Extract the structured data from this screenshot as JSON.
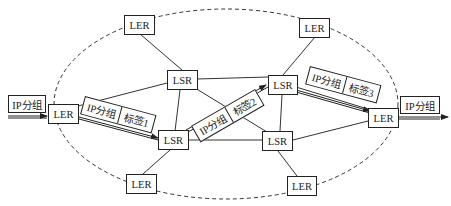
{
  "diagram": {
    "title": "",
    "nodes": [
      {
        "id": "ler_top_left",
        "type": "LER",
        "label": "LER"
      },
      {
        "id": "ler_top_right",
        "type": "LER",
        "label": "LER"
      },
      {
        "id": "lsr_upper_left",
        "type": "LSR",
        "label": "LSR"
      },
      {
        "id": "lsr_upper_right",
        "type": "LSR",
        "label": "LSR"
      },
      {
        "id": "ler_ingress",
        "type": "LER",
        "label": "LER"
      },
      {
        "id": "lsr_center_left",
        "type": "LSR",
        "label": "LSR"
      },
      {
        "id": "lsr_center_right",
        "type": "LSR",
        "label": "LSR"
      },
      {
        "id": "ler_egress",
        "type": "LER",
        "label": "LER"
      },
      {
        "id": "ler_bottom_left",
        "type": "LER",
        "label": "LER"
      },
      {
        "id": "ler_bottom_right",
        "type": "LER",
        "label": "LER"
      }
    ],
    "edges": [
      [
        "ler_top_left",
        "lsr_upper_left"
      ],
      [
        "ler_top_right",
        "lsr_upper_right"
      ],
      [
        "lsr_upper_left",
        "lsr_upper_right"
      ],
      [
        "lsr_upper_left",
        "ler_ingress"
      ],
      [
        "lsr_upper_left",
        "lsr_center_left"
      ],
      [
        "lsr_upper_left",
        "lsr_center_right"
      ],
      [
        "lsr_upper_right",
        "lsr_center_right"
      ],
      [
        "lsr_upper_right",
        "ler_egress"
      ],
      [
        "ler_ingress",
        "lsr_center_left"
      ],
      [
        "lsr_center_left",
        "lsr_center_right"
      ],
      [
        "lsr_center_left",
        "lsr_upper_right"
      ],
      [
        "lsr_center_left",
        "ler_bottom_left"
      ],
      [
        "lsr_center_right",
        "ler_egress"
      ],
      [
        "lsr_center_right",
        "ler_bottom_right"
      ]
    ],
    "input_packet": {
      "label": "IP分组"
    },
    "output_packet": {
      "label": "IP分组"
    },
    "labeled_packets": [
      {
        "payload": "IP分组",
        "label": "标签1"
      },
      {
        "payload": "IP分组",
        "label": "标签2"
      },
      {
        "payload": "IP分组",
        "label": "标签3"
      }
    ],
    "boundary": "MPLS domain (dashed ellipse)"
  }
}
